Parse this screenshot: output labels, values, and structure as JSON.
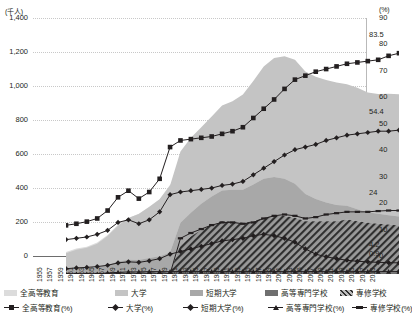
{
  "axes": {
    "left_unit": "(千人)",
    "right_unit": "(%)",
    "left_ticks": [
      "1,400",
      "1,200",
      "1,000",
      "800",
      "600",
      "400",
      "200",
      "0"
    ],
    "left_values": [
      1400,
      1200,
      1000,
      800,
      600,
      400,
      200,
      0
    ],
    "right_ticks": [
      "90",
      "80",
      "70",
      "60",
      "50",
      "40",
      "30",
      "20",
      "10",
      "0"
    ],
    "right_values": [
      90,
      80,
      70,
      60,
      50,
      40,
      30,
      20,
      10,
      0
    ],
    "left_min": 0,
    "left_max": 1400,
    "right_min": 0,
    "right_max": 90
  },
  "value_labels": [
    {
      "text": "83.5",
      "value": 83.5
    },
    {
      "text": "54.4",
      "value": 54.4
    },
    {
      "text": "24",
      "value": 24.0
    },
    {
      "text": "4.2",
      "value": 4.2
    },
    {
      "text": "0.9",
      "value": 0.9
    }
  ],
  "legend": {
    "areas": [
      {
        "label": "全高等教育",
        "fill": "#dcdcdc",
        "pattern": "solid"
      },
      {
        "label": "大学",
        "fill": "#c4c4c4",
        "pattern": "solid"
      },
      {
        "label": "短期大学",
        "fill": "#a8a8a8",
        "pattern": "solid"
      },
      {
        "label": "高等専門学校",
        "fill": "#6f6f6f",
        "pattern": "solid"
      },
      {
        "label": "専修学校",
        "fill": "#808080",
        "pattern": "hatch"
      }
    ],
    "lines": [
      {
        "label": "全高等教育(%)",
        "marker": "square"
      },
      {
        "label": "大学(%)",
        "marker": "diamond"
      },
      {
        "label": "短期大学(%)",
        "marker": "diamond"
      },
      {
        "label": "高等専門学校(%)",
        "marker": "triangle"
      },
      {
        "label": "専修学校(%)",
        "marker": "dash"
      }
    ]
  },
  "chart_data": {
    "type": "area",
    "title": "",
    "subtitle": "",
    "xlabel": "",
    "ylabel": "(千人)",
    "y2label": "(%)",
    "ylim": [
      0,
      1400
    ],
    "y2lim": [
      0,
      90
    ],
    "grid": true,
    "legend_position": "bottom",
    "x": [
      1955,
      1957,
      1959,
      1961,
      1963,
      1965,
      1967,
      1969,
      1971,
      1973,
      1975,
      1977,
      1979,
      1981,
      1983,
      1985,
      1987,
      1989,
      1991,
      1993,
      1995,
      1997,
      1999,
      2001,
      2003,
      2005,
      2007,
      2009,
      2011,
      2013,
      2015,
      2017,
      2019
    ],
    "categories": [
      "1955",
      "1957",
      "1959",
      "1961",
      "1963",
      "1965",
      "1967",
      "1969",
      "1971",
      "1973",
      "1975",
      "1977",
      "1979",
      "1981",
      "1983",
      "1985",
      "1987",
      "1989",
      "1991",
      "1993",
      "1995",
      "1997",
      "1999",
      "2001",
      "2003",
      "2005",
      "2007",
      "2009",
      "2011",
      "2013",
      "2015",
      "2017",
      "2019"
    ],
    "series": [
      {
        "name": "全高等教育",
        "kind": "area",
        "unit": "千人",
        "axis": "left",
        "fill": "#dcdcdc",
        "values": [
          130,
          150,
          160,
          185,
          230,
          290,
          330,
          355,
          395,
          440,
          525,
          565,
          595,
          620,
          650,
          690,
          710,
          760,
          830,
          900,
          960,
          990,
          1010,
          1000,
          1000,
          1000,
          1010,
          1000,
          1000,
          990,
          985,
          995,
          1010
        ]
      },
      {
        "name": "大学",
        "kind": "area",
        "unit": "千人",
        "axis": "left",
        "fill": "#c4c4c4",
        "values": [
          100,
          112,
          120,
          140,
          170,
          210,
          245,
          270,
          300,
          335,
          395,
          420,
          440,
          450,
          470,
          500,
          520,
          560,
          610,
          660,
          700,
          720,
          730,
          720,
          720,
          720,
          720,
          715,
          715,
          705,
          705,
          715,
          720
        ]
      },
      {
        "name": "短期大学",
        "kind": "area",
        "unit": "千人",
        "axis": "left",
        "fill": "#a8a8a8",
        "values": [
          22,
          30,
          34,
          38,
          50,
          68,
          76,
          74,
          84,
          95,
          115,
          130,
          140,
          152,
          165,
          180,
          185,
          195,
          215,
          230,
          230,
          220,
          200,
          160,
          130,
          110,
          95,
          80,
          70,
          62,
          58,
          55,
          52
        ]
      },
      {
        "name": "高等専門学校",
        "kind": "area",
        "unit": "千人",
        "axis": "left",
        "fill": "#6f6f6f",
        "values": [
          0,
          0,
          0,
          0,
          4,
          6,
          8,
          9,
          10,
          10,
          11,
          11,
          11,
          11,
          11,
          11,
          11,
          11,
          11,
          11,
          11,
          11,
          11,
          11,
          11,
          11,
          11,
          11,
          11,
          11,
          11,
          11,
          11
        ]
      },
      {
        "name": "専修学校",
        "kind": "area",
        "unit": "千人",
        "axis": "left",
        "fill": "#808080",
        "pattern": "hatch",
        "values": [
          0,
          0,
          0,
          0,
          0,
          0,
          0,
          0,
          0,
          0,
          0,
          160,
          210,
          250,
          280,
          300,
          300,
          290,
          300,
          320,
          330,
          330,
          320,
          300,
          300,
          300,
          300,
          310,
          300,
          290,
          285,
          280,
          275
        ]
      },
      {
        "name": "全高等教育(%)",
        "kind": "line",
        "unit": "%",
        "axis": "right",
        "marker": "square",
        "values": [
          18.4,
          19.0,
          19.8,
          21.0,
          24.0,
          29.0,
          31.5,
          28.5,
          31.0,
          36.0,
          48.0,
          50.5,
          51.0,
          51.5,
          52.0,
          53.0,
          54.0,
          55.5,
          59.0,
          62.5,
          66.0,
          70.0,
          73.5,
          75.0,
          76.5,
          77.5,
          78.5,
          79.5,
          80.0,
          80.5,
          81.0,
          82.5,
          83.5
        ]
      },
      {
        "name": "大学(%)",
        "kind": "line",
        "unit": "%",
        "axis": "right",
        "marker": "diamond",
        "values": [
          13.0,
          13.5,
          14.0,
          15.0,
          16.5,
          19.5,
          20.5,
          19.0,
          20.5,
          23.5,
          30.0,
          31.0,
          31.5,
          32.0,
          32.5,
          33.5,
          34.0,
          35.0,
          37.5,
          40.0,
          42.5,
          45.0,
          47.0,
          48.0,
          49.0,
          50.5,
          51.5,
          52.5,
          53.0,
          53.5,
          54.0,
          54.0,
          54.4
        ]
      },
      {
        "name": "短期大学(%)",
        "kind": "line",
        "unit": "%",
        "axis": "right",
        "marker": "diamond",
        "values": [
          2.0,
          2.3,
          2.5,
          2.8,
          3.3,
          4.2,
          4.6,
          4.4,
          5.0,
          5.8,
          7.5,
          8.5,
          9.5,
          10.5,
          11.5,
          12.5,
          13.0,
          13.5,
          14.5,
          15.0,
          14.5,
          13.5,
          12.0,
          9.5,
          7.5,
          6.5,
          5.8,
          5.2,
          4.8,
          4.6,
          4.4,
          4.3,
          4.2
        ]
      },
      {
        "name": "高等専門学校(%)",
        "kind": "line",
        "unit": "%",
        "axis": "right",
        "marker": "triangle",
        "values": [
          0,
          0,
          0,
          0,
          0.4,
          0.6,
          0.8,
          0.8,
          0.9,
          0.9,
          0.9,
          0.9,
          0.9,
          0.9,
          0.9,
          0.9,
          0.9,
          0.9,
          0.9,
          0.9,
          0.9,
          0.9,
          0.9,
          0.9,
          0.9,
          0.9,
          0.9,
          0.9,
          0.9,
          0.9,
          0.9,
          0.9,
          0.9
        ]
      },
      {
        "name": "専修学校(%)",
        "kind": "line",
        "unit": "%",
        "axis": "right",
        "marker": "dash",
        "values": [
          0,
          0,
          0,
          0,
          0,
          0,
          0,
          0,
          0,
          0,
          0,
          13.5,
          15.5,
          17.0,
          18.5,
          19.5,
          19.5,
          19.0,
          19.5,
          21.0,
          22.0,
          22.5,
          22.0,
          21.0,
          21.5,
          22.5,
          23.0,
          23.5,
          23.5,
          23.5,
          23.8,
          24.0,
          24.0
        ]
      }
    ]
  }
}
